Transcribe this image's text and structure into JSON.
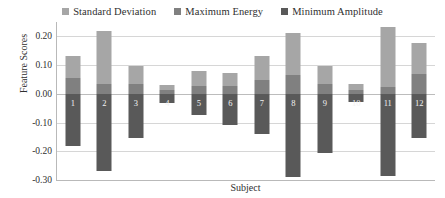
{
  "chart_data": {
    "type": "bar",
    "subtype": "stacked-bar",
    "title": "",
    "xlabel": "Subject",
    "ylabel": "Feature Scores",
    "grid": true,
    "legend_position": "top-center",
    "ylim": [
      -0.3,
      0.25
    ],
    "yticks": [
      0.2,
      0.1,
      0.0,
      -0.1,
      -0.2,
      -0.3
    ],
    "ytick_labels": [
      "0.20",
      "0.10",
      "0.00",
      "-0.10",
      "-0.20",
      "-0.30"
    ],
    "categories": [
      "1",
      "2",
      "3",
      "4",
      "5",
      "6",
      "7",
      "8",
      "9",
      "10",
      "11",
      "12"
    ],
    "series": [
      {
        "name": "Standard Deviation",
        "color": "#a6a6a6",
        "values": [
          0.075,
          0.185,
          0.062,
          0.018,
          0.051,
          0.045,
          0.084,
          0.145,
          0.062,
          0.021,
          0.21,
          0.108
        ]
      },
      {
        "name": "Maximum Energy",
        "color": "#808080",
        "values": [
          0.055,
          0.035,
          0.035,
          0.012,
          0.028,
          0.027,
          0.048,
          0.066,
          0.034,
          0.013,
          0.022,
          0.07
        ]
      },
      {
        "name": "Minimum Amplitude",
        "color": "#595959",
        "values": [
          -0.18,
          -0.27,
          -0.155,
          -0.032,
          -0.075,
          -0.11,
          -0.14,
          -0.29,
          -0.205,
          -0.03,
          -0.285,
          -0.155
        ]
      }
    ]
  },
  "legend": {
    "items": [
      {
        "label": "Standard Deviation",
        "color": "#a6a6a6"
      },
      {
        "label": "Maximum Energy",
        "color": "#808080"
      },
      {
        "label": "Minimum Amplitude",
        "color": "#595959"
      }
    ]
  },
  "axes": {
    "y_title": "Feature Scores",
    "x_title": "Subject"
  }
}
